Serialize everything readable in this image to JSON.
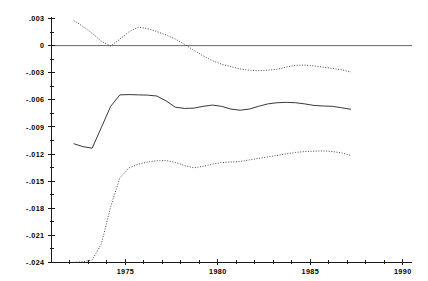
{
  "chart_data": {
    "type": "line",
    "title": "",
    "subtitle": "",
    "xlabel": "",
    "ylabel": "",
    "grid": false,
    "legend_position": "none",
    "xlim": [
      1971.0,
      1990.5
    ],
    "ylim": [
      -0.024,
      0.003
    ],
    "x_ticks_labeled": [
      1975,
      1980,
      1985,
      1990
    ],
    "x_tick_labels": [
      "1975",
      "1980",
      "1985",
      "1990"
    ],
    "x_minor_tick_interval": 1,
    "y_ticks": [
      0.003,
      0,
      -0.003,
      -0.006,
      -0.009,
      -0.012,
      -0.015,
      -0.018,
      -0.021,
      -0.024
    ],
    "y_tick_labels": [
      ".003",
      "0",
      "-.003",
      "-.006",
      "-.009",
      "-.012",
      "-.015",
      "-.018",
      "-.021",
      "-.024"
    ],
    "zero_reference_line": 0,
    "x": [
      1972.2,
      1972.7,
      1973.2,
      1973.7,
      1974.2,
      1974.7,
      1975.2,
      1975.7,
      1976.2,
      1976.7,
      1977.2,
      1977.7,
      1978.2,
      1978.7,
      1979.2,
      1979.7,
      1980.2,
      1980.7,
      1981.2,
      1981.7,
      1982.2,
      1982.7,
      1983.2,
      1983.7,
      1984.2,
      1984.7,
      1985.2,
      1985.7,
      1986.2,
      1986.7,
      1987.2
    ],
    "series": [
      {
        "name": "upper-confidence-band",
        "style": "dotted",
        "values": [
          0.00278,
          0.00212,
          0.00135,
          0.00048,
          -5e-05,
          0.00072,
          0.00155,
          0.00205,
          0.00188,
          0.00155,
          0.00118,
          0.00072,
          0.00015,
          -0.00052,
          -0.00112,
          -0.00168,
          -0.00205,
          -0.00232,
          -0.00258,
          -0.00272,
          -0.00278,
          -0.00272,
          -0.00262,
          -0.00238,
          -0.00218,
          -0.00215,
          -0.00225,
          -0.00238,
          -0.00252,
          -0.00268,
          -0.00292
        ]
      },
      {
        "name": "point-estimate",
        "style": "solid",
        "values": [
          -0.01085,
          -0.01118,
          -0.01135,
          -0.00905,
          -0.00672,
          -0.00545,
          -0.00542,
          -0.00545,
          -0.00548,
          -0.00558,
          -0.00612,
          -0.00682,
          -0.00695,
          -0.00692,
          -0.00672,
          -0.00658,
          -0.00672,
          -0.00702,
          -0.00715,
          -0.00702,
          -0.00672,
          -0.00645,
          -0.00632,
          -0.00628,
          -0.00632,
          -0.00645,
          -0.00662,
          -0.00668,
          -0.00672,
          -0.00688,
          -0.00705
        ]
      },
      {
        "name": "lower-confidence-band",
        "style": "dotted",
        "values": [
          -0.02398,
          -0.02392,
          -0.02372,
          -0.02192,
          -0.01782,
          -0.01462,
          -0.01352,
          -0.01312,
          -0.01288,
          -0.01275,
          -0.01272,
          -0.01292,
          -0.01328,
          -0.01352,
          -0.01335,
          -0.01312,
          -0.01295,
          -0.01288,
          -0.01282,
          -0.01265,
          -0.01248,
          -0.01232,
          -0.01215,
          -0.01198,
          -0.01182,
          -0.01172,
          -0.01168,
          -0.01165,
          -0.01172,
          -0.01188,
          -0.01215
        ]
      }
    ]
  }
}
